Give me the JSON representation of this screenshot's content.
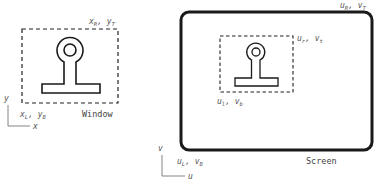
{
  "diagram": {
    "window": {
      "caption": "Window",
      "corner_top_right": "x_R, y_T",
      "corner_bottom_left": "x_L, y_B",
      "axis_x": "x",
      "axis_y": "y"
    },
    "screen": {
      "caption": "Screen",
      "corner_top_right": "u_R, v_T",
      "corner_bottom_left": "u_L, v_B",
      "axis_u": "u",
      "axis_v": "v",
      "viewport": {
        "corner_top_right": "u_r, v_t",
        "corner_bottom_left": "u_l, v_b"
      }
    },
    "object_shape": "keyhole-stand (circle ring on stem with base bar)",
    "colors": {
      "stroke": "#1a1a1a",
      "label": "#555555",
      "background": "#ffffff"
    }
  }
}
